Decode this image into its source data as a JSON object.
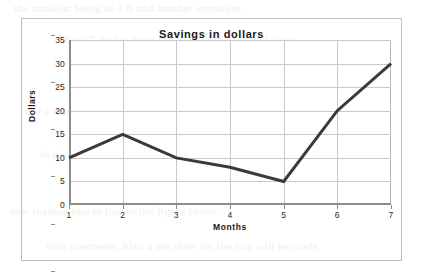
{
  "figure": {
    "border_color": "#bdbdbd",
    "background": "#ffffff"
  },
  "chart_data": {
    "type": "line",
    "title": "Savings in dollars",
    "xlabel": "Months",
    "ylabel": "Dollars",
    "x": [
      1,
      2,
      3,
      4,
      5,
      6,
      7
    ],
    "values": [
      10,
      15,
      10,
      8,
      5,
      20,
      30
    ],
    "categories": [
      "1",
      "2",
      "3",
      "4",
      "5",
      "6",
      "7"
    ],
    "xtick_labels": [
      "1",
      "2",
      "3",
      "4",
      "5",
      "6",
      "7"
    ],
    "ytick_labels": [
      "0",
      "5",
      "10",
      "15",
      "20",
      "25",
      "30",
      "35"
    ],
    "yticks": [
      0,
      5,
      10,
      15,
      20,
      25,
      30,
      35
    ],
    "xlim": [
      1,
      7
    ],
    "ylim": [
      0,
      35
    ],
    "grid": true,
    "legend": false,
    "legend_position": "none",
    "series_color": "#3a3a3a",
    "grid_color": "#c9c9c9",
    "axis_color": "#8d8d8d",
    "line_width": 3,
    "markers": false,
    "series": [
      {
        "name": "Savings",
        "values": [
          10,
          15,
          10,
          8,
          5,
          20,
          30
        ]
      }
    ]
  },
  "background_bleed": {
    "note": "faint reverse-side scan text, illegible",
    "lines": [
      "the smallest being of 4 ft and another employee",
      "about 7 inches from top to bottom. this will show",
      "and a matched plot of the chart for the line will be made",
      "in the bottom portion with the second chart area",
      "new reading line to line in the figure below",
      "with treatment. Also a the chart for the line will be made"
    ]
  }
}
